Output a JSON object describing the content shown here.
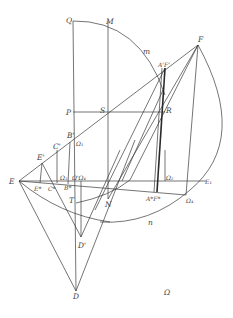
{
  "figure": {
    "width": 233,
    "height": 318,
    "background": "#ffffff",
    "stroke_color": "#3a3a3a",
    "points": {
      "Q": {
        "x": 73,
        "y": 21
      },
      "M": {
        "x": 108,
        "y": 21
      },
      "F": {
        "x": 198,
        "y": 45
      },
      "AF_prime": {
        "x": 165,
        "y": 68
      },
      "P": {
        "x": 73,
        "y": 112
      },
      "S": {
        "x": 108,
        "y": 112
      },
      "R": {
        "x": 163,
        "y": 112
      },
      "B_prime": {
        "x": 73,
        "y": 140
      },
      "C_prime": {
        "x": 57,
        "y": 150
      },
      "E_prime": {
        "x": 42,
        "y": 163
      },
      "E": {
        "x": 19,
        "y": 181
      },
      "E_star": {
        "x": 40,
        "y": 183
      },
      "C_star": {
        "x": 55,
        "y": 185
      },
      "B_star": {
        "x": 68,
        "y": 184
      },
      "E1": {
        "x": 206,
        "y": 181
      },
      "T": {
        "x": 76,
        "y": 203
      },
      "N": {
        "x": 108,
        "y": 199
      },
      "AF_star": {
        "x": 157,
        "y": 192
      },
      "Omega4": {
        "x": 186,
        "y": 195
      },
      "D_prime": {
        "x": 81,
        "y": 237
      },
      "D": {
        "x": 76,
        "y": 291
      }
    },
    "labels": [
      {
        "id": "Q",
        "text": "Q",
        "x": 66,
        "y": 23
      },
      {
        "id": "M",
        "text": "M",
        "x": 106,
        "y": 24
      },
      {
        "id": "m",
        "text": "m",
        "x": 143,
        "y": 54
      },
      {
        "id": "F",
        "text": "F",
        "x": 198,
        "y": 42
      },
      {
        "id": "AF_prime",
        "text": "A'F'",
        "x": 161,
        "y": 67
      },
      {
        "id": "P",
        "text": "P",
        "x": 66,
        "y": 115
      },
      {
        "id": "S",
        "text": "S",
        "x": 100,
        "y": 113
      },
      {
        "id": "R",
        "text": "R",
        "x": 166,
        "y": 113
      },
      {
        "id": "B_prime",
        "text": "B'",
        "x": 67,
        "y": 138
      },
      {
        "id": "Omega1_top",
        "text": "Ω₁",
        "x": 77,
        "y": 146
      },
      {
        "id": "C_prime",
        "text": "C'",
        "x": 53,
        "y": 149
      },
      {
        "id": "E_prime",
        "text": "E'",
        "x": 37,
        "y": 160
      },
      {
        "id": "E",
        "text": "E",
        "x": 9,
        "y": 184
      },
      {
        "id": "Omega3",
        "text": "Ω₃",
        "x": 61,
        "y": 180
      },
      {
        "id": "Omega_prime_Omega4",
        "text": "Ω'Ω₄",
        "x": 74,
        "y": 180
      },
      {
        "id": "Omega2",
        "text": "Ω₂",
        "x": 166,
        "y": 180
      },
      {
        "id": "E1",
        "text": "E₁",
        "x": 205,
        "y": 184
      },
      {
        "id": "E_star",
        "text": "E*",
        "x": 35,
        "y": 191
      },
      {
        "id": "C_star",
        "text": "C*",
        "x": 48,
        "y": 191
      },
      {
        "id": "B_star",
        "text": "B*",
        "x": 65,
        "y": 190
      },
      {
        "id": "T",
        "text": "T",
        "x": 69,
        "y": 203
      },
      {
        "id": "N",
        "text": "N",
        "x": 106,
        "y": 207
      },
      {
        "id": "AF_star",
        "text": "A*F*",
        "x": 147,
        "y": 201
      },
      {
        "id": "Omega4_bottom",
        "text": "Ω₄",
        "x": 186,
        "y": 203
      },
      {
        "id": "n",
        "text": "n",
        "x": 148,
        "y": 225
      },
      {
        "id": "D_prime",
        "text": "D'",
        "x": 78,
        "y": 248
      },
      {
        "id": "D",
        "text": "D",
        "x": 73,
        "y": 299
      },
      {
        "id": "Omega",
        "text": "Ω",
        "x": 164,
        "y": 295
      }
    ]
  }
}
